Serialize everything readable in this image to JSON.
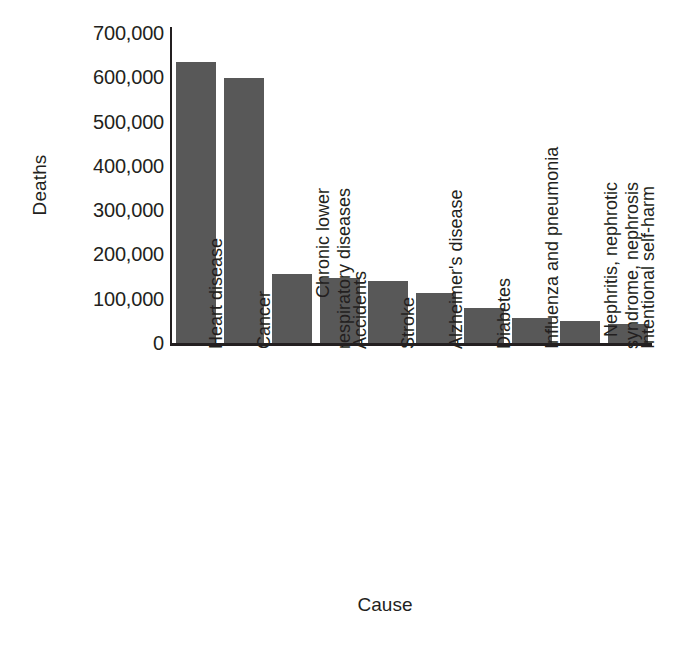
{
  "chart_data": {
    "type": "bar",
    "title": "",
    "xlabel": "Cause",
    "ylabel": "Deaths",
    "ylim": [
      0,
      700000
    ],
    "ytick_step": 100000,
    "grid": false,
    "legend": null,
    "bar_color": "#585858",
    "axis_color": "#231f20",
    "background_color": "#ffffff",
    "ytick_labels": [
      "700,000",
      "600,000",
      "500,000",
      "400,000",
      "300,000",
      "200,000",
      "100,000",
      "0"
    ],
    "ytick_values": [
      700000,
      600000,
      500000,
      400000,
      300000,
      200000,
      100000,
      0
    ],
    "categories": [
      "Heart disease",
      "Cancer",
      "Chronic lower respiratory diseases",
      "Accidents",
      "Stroke",
      "Alzheimer's disease",
      "Diabetes",
      "Influenza and pneumonia",
      "Nephritis, nephrotic syndrome, nephrosis",
      "Intentional self-harm"
    ],
    "category_lines": [
      [
        "Heart disease"
      ],
      [
        "Cancer"
      ],
      [
        "Chronic lower",
        "respiratory diseases"
      ],
      [
        "Accidents"
      ],
      [
        "Stroke"
      ],
      [
        "Alzheimer's disease"
      ],
      [
        "Diabetes"
      ],
      [
        "Influenza and pneumonia"
      ],
      [
        "Nephritis, nephrotic",
        "syndrome, nephrosis"
      ],
      [
        "Intentional self-harm"
      ]
    ],
    "values": [
      635000,
      598000,
      155000,
      147000,
      140000,
      113000,
      80000,
      57000,
      50000,
      43000
    ]
  },
  "caption": {
    "text": ""
  }
}
